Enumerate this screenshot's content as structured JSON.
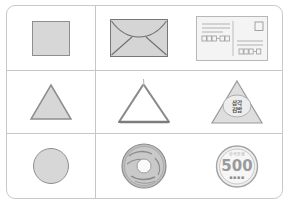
{
  "worksheet": {
    "title": "Shape matching worksheet",
    "accent_color": "#c6c6c6",
    "shape_fill": "#d7d7d7",
    "shape_stroke": "#8e8e8e",
    "columns": 2,
    "rows": 3
  },
  "rows": [
    {
      "id": "row-square",
      "shape_name": "square",
      "prototype": {
        "name": "square-shape",
        "label": "square"
      },
      "examples": [
        {
          "name": "envelope",
          "label": "envelope"
        },
        {
          "name": "postcard",
          "label": "postcard"
        }
      ]
    },
    {
      "id": "row-triangle",
      "shape_name": "triangle",
      "prototype": {
        "name": "triangle-shape",
        "label": "triangle"
      },
      "examples": [
        {
          "name": "triangle-instrument",
          "label": "triangle instrument"
        },
        {
          "name": "onigiri",
          "label": "samgak gimbap"
        }
      ]
    },
    {
      "id": "row-circle",
      "shape_name": "circle",
      "prototype": {
        "name": "circle-shape",
        "label": "circle"
      },
      "examples": [
        {
          "name": "donut",
          "label": "donut"
        },
        {
          "name": "coin",
          "label": "500 won coin"
        }
      ]
    }
  ],
  "postcard": {
    "name": "postcard",
    "stamp_label": "stamp box",
    "postal_code_left": "000-000",
    "postal_code_right": "000-000",
    "address_lines": 3
  },
  "onigiri": {
    "line1": "삼각",
    "line2": "김밥"
  },
  "coin": {
    "value": "500",
    "top_text": "한국은행",
    "bottom_text": "▪▪▪▪"
  }
}
